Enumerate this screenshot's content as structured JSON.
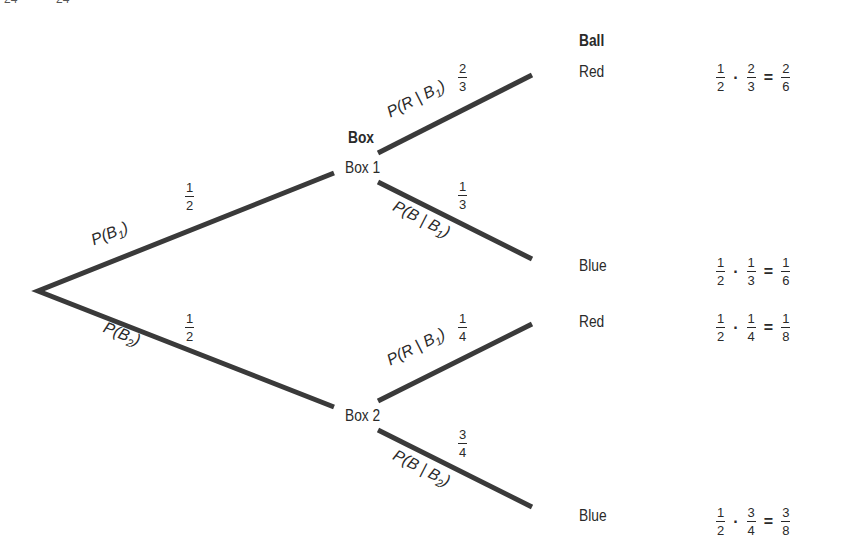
{
  "header_fragment": [
    "24",
    "24"
  ],
  "columns": {
    "box_header": "Box",
    "ball_header": "Ball"
  },
  "root": {
    "branches": [
      {
        "label": "P(B1)",
        "label_main": "P(B",
        "label_sub": "1",
        "label_close": ")",
        "prob": {
          "num": "1",
          "den": "2"
        },
        "node": "Box 1",
        "children": [
          {
            "label_main": "P(R | B",
            "label_sub": "1",
            "label_close": ")",
            "prob": {
              "num": "2",
              "den": "3"
            },
            "outcome": "Red",
            "calc": {
              "a": {
                "num": "1",
                "den": "2"
              },
              "b": {
                "num": "2",
                "den": "3"
              },
              "r": {
                "num": "2",
                "den": "6"
              }
            }
          },
          {
            "label_main": "P(B | B",
            "label_sub": "1",
            "label_close": ")",
            "prob": {
              "num": "1",
              "den": "3"
            },
            "outcome": "Blue",
            "calc": {
              "a": {
                "num": "1",
                "den": "2"
              },
              "b": {
                "num": "1",
                "den": "3"
              },
              "r": {
                "num": "1",
                "den": "6"
              }
            }
          }
        ]
      },
      {
        "label": "P(B2)",
        "label_main": "P(B",
        "label_sub": "2",
        "label_close": ")",
        "prob": {
          "num": "1",
          "den": "2"
        },
        "node": "Box 2",
        "children": [
          {
            "label_main": "P(R | B",
            "label_sub": "1",
            "label_close": ")",
            "prob": {
              "num": "1",
              "den": "4"
            },
            "outcome": "Red",
            "calc": {
              "a": {
                "num": "1",
                "den": "2"
              },
              "b": {
                "num": "1",
                "den": "4"
              },
              "r": {
                "num": "1",
                "den": "8"
              }
            }
          },
          {
            "label_main": "P(B | B",
            "label_sub": "2",
            "label_close": ")",
            "prob": {
              "num": "3",
              "den": "4"
            },
            "outcome": "Blue",
            "calc": {
              "a": {
                "num": "1",
                "den": "2"
              },
              "b": {
                "num": "3",
                "den": "4"
              },
              "r": {
                "num": "3",
                "den": "8"
              }
            }
          }
        ]
      }
    ]
  },
  "operators": {
    "times": "·",
    "equals": "="
  },
  "colors": {
    "line": "#3a3a3a",
    "text": "#2a2a2a",
    "background": "#ffffff"
  }
}
